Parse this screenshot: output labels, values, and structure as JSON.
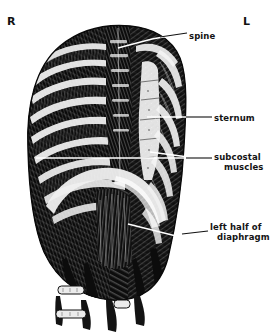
{
  "figure": {
    "kind": "anatomical-illustration",
    "style": "black-and-white engraving / line drawing",
    "orientation_markers": [
      {
        "name": "right-side-marker",
        "text": "R"
      },
      {
        "name": "left-side-marker",
        "text": "L"
      }
    ],
    "labels": [
      {
        "id": "spine",
        "line1": "spine",
        "line2": ""
      },
      {
        "id": "sternum",
        "line1": "sternum",
        "line2": ""
      },
      {
        "id": "subcostal",
        "line1": "subcostal",
        "line2": "muscles"
      },
      {
        "id": "diaphragm",
        "line1": "left half of",
        "line2": "diaphragm"
      }
    ],
    "colors": {
      "ink": "#111111",
      "paper": "#ffffff",
      "leader_line": "#ffffff",
      "leader_line_outside": "#111111"
    }
  }
}
